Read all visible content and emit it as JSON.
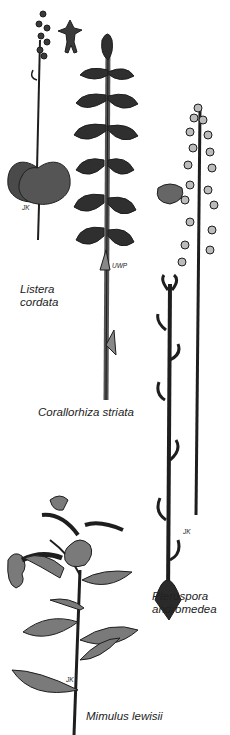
{
  "plates": [
    {
      "id": "listera",
      "name_line1": "Listera",
      "name_line2": "cordata",
      "signature": "JK"
    },
    {
      "id": "corallorhiza",
      "name": "Corallorhiza striata",
      "signature": "UWP"
    },
    {
      "id": "pterospora",
      "name_line1": "Pterospora",
      "name_line2": "andromedea",
      "signature": "JK"
    },
    {
      "id": "mimulus",
      "name": "Mimulus lewisii",
      "signature": "JK"
    }
  ],
  "colors": {
    "ink": "#1e1e1e",
    "dark_fill": "#3a3a3a",
    "mid_fill": "#6e6e6e",
    "light_fill": "#8a8a8a",
    "paper": "#ffffff"
  }
}
